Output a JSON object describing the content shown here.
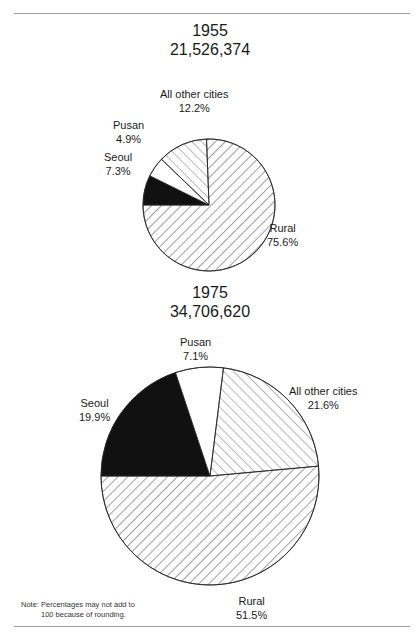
{
  "chart_data": [
    {
      "type": "pie",
      "title": "1955",
      "subtitle": "21,526,374",
      "categories": [
        "Rural",
        "Seoul",
        "Pusan",
        "All other cities"
      ],
      "values": [
        75.6,
        7.3,
        4.9,
        12.2
      ],
      "unit": "%",
      "fills": {
        "Rural": "forward-diagonal hatch",
        "Seoul": "solid black",
        "Pusan": "white",
        "All other cities": "back-diagonal hatch"
      },
      "labels": [
        {
          "name": "Rural",
          "value": "75.6%"
        },
        {
          "name": "Seoul",
          "value": "7.3%"
        },
        {
          "name": "Pusan",
          "value": "4.9%"
        },
        {
          "name": "All other cities",
          "value": "12.2%"
        }
      ]
    },
    {
      "type": "pie",
      "title": "1975",
      "subtitle": "34,706,620",
      "categories": [
        "Rural",
        "Seoul",
        "Pusan",
        "All other cities"
      ],
      "values": [
        51.5,
        19.9,
        7.1,
        21.6
      ],
      "unit": "%",
      "fills": {
        "Rural": "forward-diagonal hatch",
        "Seoul": "solid black",
        "Pusan": "white",
        "All other cities": "back-diagonal hatch"
      },
      "labels": [
        {
          "name": "Rural",
          "value": "51.5%"
        },
        {
          "name": "Seoul",
          "value": "19.9%"
        },
        {
          "name": "Pusan",
          "value": "7.1%"
        },
        {
          "name": "All other cities",
          "value": "21.6%"
        }
      ]
    }
  ],
  "note": {
    "line1": "Note: Percentages may not add to",
    "line2": "100  because of rounding."
  },
  "colors": {
    "ink": "#1a1a1a",
    "background": "#ffffff",
    "rule": "#9a9a9a"
  }
}
